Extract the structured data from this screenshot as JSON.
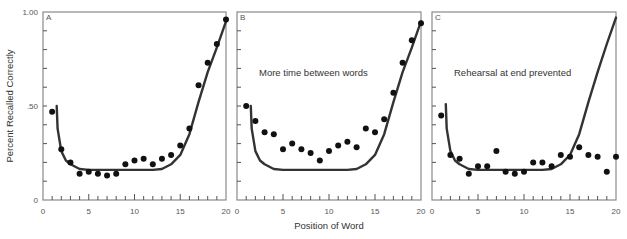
{
  "chart_data": [
    {
      "type": "scatter",
      "panel": "A",
      "annotation": "",
      "xlabel": "Position of Word",
      "ylabel": "Percent Recalled Correctly",
      "xlim": [
        0,
        20
      ],
      "ylim": [
        0,
        1.0
      ],
      "x_ticks": [
        0,
        5,
        10,
        15,
        20
      ],
      "y_ticks": [
        "0",
        ".50",
        "1.00"
      ],
      "grid": false,
      "series": [
        {
          "name": "observed",
          "x": [
            1,
            2,
            3,
            4,
            5,
            6,
            7,
            8,
            9,
            10,
            11,
            12,
            13,
            14,
            15,
            16,
            17,
            18,
            19,
            20
          ],
          "values": [
            0.47,
            0.27,
            0.2,
            0.14,
            0.15,
            0.14,
            0.13,
            0.14,
            0.19,
            0.21,
            0.22,
            0.19,
            0.22,
            0.24,
            0.29,
            0.38,
            0.61,
            0.73,
            0.83,
            0.96
          ]
        },
        {
          "name": "model curve",
          "x": [
            1.5,
            1.6,
            2,
            2.5,
            3,
            4,
            5,
            12,
            13,
            14,
            15,
            16,
            17,
            18,
            19,
            20
          ],
          "values": [
            0.5,
            0.38,
            0.26,
            0.21,
            0.19,
            0.165,
            0.16,
            0.16,
            0.165,
            0.19,
            0.24,
            0.35,
            0.52,
            0.68,
            0.81,
            0.95
          ]
        }
      ]
    },
    {
      "type": "scatter",
      "panel": "B",
      "annotation": "More time between words",
      "xlabel": "Position of Word",
      "ylabel": "",
      "xlim": [
        0,
        20
      ],
      "ylim": [
        0,
        1.0
      ],
      "x_ticks": [
        0,
        5,
        10,
        15,
        20
      ],
      "grid": false,
      "series": [
        {
          "name": "observed",
          "x": [
            1,
            2,
            3,
            4,
            5,
            6,
            7,
            8,
            9,
            10,
            11,
            12,
            13,
            14,
            15,
            16,
            17,
            18,
            19,
            20
          ],
          "values": [
            0.5,
            0.42,
            0.36,
            0.35,
            0.27,
            0.3,
            0.27,
            0.25,
            0.21,
            0.26,
            0.29,
            0.31,
            0.28,
            0.38,
            0.36,
            0.43,
            0.57,
            0.73,
            0.85,
            0.94
          ]
        },
        {
          "name": "model curve",
          "x": [
            1.5,
            1.6,
            2,
            2.5,
            3,
            4,
            5,
            12,
            13,
            14,
            15,
            16,
            17,
            18,
            19,
            20
          ],
          "values": [
            0.5,
            0.38,
            0.26,
            0.21,
            0.19,
            0.165,
            0.16,
            0.16,
            0.165,
            0.19,
            0.24,
            0.35,
            0.52,
            0.68,
            0.81,
            0.95
          ]
        }
      ]
    },
    {
      "type": "scatter",
      "panel": "C",
      "annotation": "Rehearsal at end prevented",
      "xlabel": "Position of Word",
      "ylabel": "",
      "xlim": [
        0,
        20
      ],
      "ylim": [
        0,
        1.0
      ],
      "x_ticks": [
        0,
        5,
        10,
        15,
        20
      ],
      "grid": false,
      "series": [
        {
          "name": "observed",
          "x": [
            1,
            2,
            3,
            4,
            5,
            6,
            7,
            8,
            9,
            10,
            11,
            12,
            13,
            14,
            15,
            16,
            17,
            18,
            19,
            20
          ],
          "values": [
            0.45,
            0.24,
            0.22,
            0.14,
            0.18,
            0.18,
            0.26,
            0.15,
            0.14,
            0.15,
            0.2,
            0.2,
            0.18,
            0.24,
            0.23,
            0.28,
            0.24,
            0.23,
            0.15,
            0.23
          ]
        },
        {
          "name": "model curve",
          "x": [
            1.5,
            1.6,
            2,
            2.5,
            3,
            4,
            5,
            12,
            13,
            14,
            15,
            16,
            17,
            18,
            19,
            20
          ],
          "values": [
            0.51,
            0.38,
            0.26,
            0.21,
            0.19,
            0.165,
            0.16,
            0.16,
            0.165,
            0.19,
            0.24,
            0.35,
            0.52,
            0.68,
            0.83,
            0.97
          ]
        }
      ]
    }
  ],
  "figure": {
    "ylabel": "Percent Recalled Correctly",
    "xlabel": "Position of Word",
    "y_tick_labels": {
      "top": "1.00",
      "mid": ".50",
      "bottom": "0"
    },
    "x_tick_labels": [
      "0",
      "5",
      "10",
      "15",
      "20"
    ]
  }
}
